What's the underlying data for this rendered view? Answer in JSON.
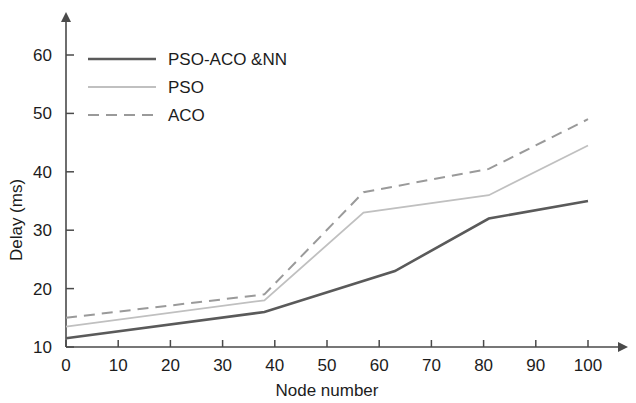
{
  "chart_data": {
    "type": "line",
    "title": "",
    "xlabel": "Node number",
    "ylabel": "Delay (ms)",
    "xlim": [
      0,
      100
    ],
    "ylim": [
      10,
      65
    ],
    "xticks": [
      0,
      10,
      20,
      30,
      40,
      50,
      60,
      70,
      80,
      90,
      100
    ],
    "yticks": [
      10,
      20,
      30,
      40,
      50,
      60
    ],
    "xtick_labels": [
      "0",
      "10",
      "20",
      "30",
      "40",
      "50",
      "60",
      "70",
      "80",
      "90",
      "100"
    ],
    "ytick_labels": [
      "10",
      "20",
      "30",
      "40",
      "50",
      "60"
    ],
    "grid": false,
    "legend_position": "top-left",
    "series": [
      {
        "name": "PSO-ACO &NN",
        "style": "solid",
        "color": "#5a5a5a",
        "width": 2.6,
        "x": [
          0,
          38,
          63,
          81,
          100
        ],
        "values": [
          11.5,
          16,
          23,
          32,
          35
        ]
      },
      {
        "name": "PSO",
        "style": "solid",
        "color": "#c0c0c0",
        "width": 1.8,
        "x": [
          0,
          38,
          57,
          81,
          100
        ],
        "values": [
          13.5,
          18,
          33,
          36,
          44.5
        ]
      },
      {
        "name": "ACO",
        "style": "dashed",
        "color": "#9a9a9a",
        "width": 2.0,
        "x": [
          0,
          38,
          57,
          81,
          100
        ],
        "values": [
          15,
          19,
          36.5,
          40.5,
          49
        ]
      }
    ]
  },
  "axis": {
    "x_title": "Node number",
    "y_title": "Delay (ms)"
  },
  "legend": {
    "entries": [
      {
        "label": "PSO-ACO &NN"
      },
      {
        "label": "PSO"
      },
      {
        "label": "ACO"
      }
    ]
  }
}
